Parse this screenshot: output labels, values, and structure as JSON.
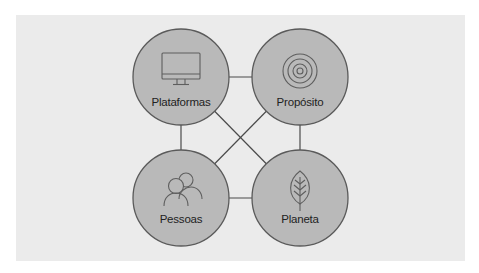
{
  "diagram": {
    "type": "four-node-network",
    "colors": {
      "page_background": "#ffffff",
      "panel_background": "#ebebeb",
      "node_fill": "#b9b9b9",
      "node_stroke": "#5a5a5a",
      "edge_color": "#4a4a4a",
      "icon_stroke": "#5e5e5e",
      "label_color": "#222222"
    },
    "nodes": [
      {
        "id": "plataformas",
        "label": "Plataformas",
        "icon": "monitor-icon",
        "position": "top-left"
      },
      {
        "id": "proposito",
        "label": "Propósito",
        "icon": "target-icon",
        "position": "top-right"
      },
      {
        "id": "pessoas",
        "label": "Pessoas",
        "icon": "people-icon",
        "position": "bottom-left"
      },
      {
        "id": "planeta",
        "label": "Planeta",
        "icon": "leaf-icon",
        "position": "bottom-right"
      }
    ],
    "edges": [
      {
        "from": "plataformas",
        "to": "proposito"
      },
      {
        "from": "pessoas",
        "to": "planeta"
      },
      {
        "from": "plataformas",
        "to": "pessoas"
      },
      {
        "from": "proposito",
        "to": "planeta"
      },
      {
        "from": "plataformas",
        "to": "planeta"
      },
      {
        "from": "proposito",
        "to": "pessoas"
      }
    ]
  }
}
